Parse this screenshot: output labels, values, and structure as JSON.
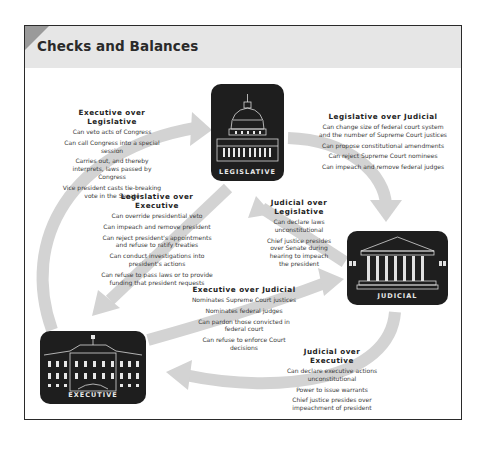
{
  "title": "Checks and Balances",
  "branches": {
    "legislative": {
      "label": "LEGISLATIVE",
      "icon": "capitol-building-icon"
    },
    "judicial": {
      "label": "JUDICIAL",
      "icon": "supreme-court-icon"
    },
    "executive": {
      "label": "EXECUTIVE",
      "icon": "white-house-icon"
    }
  },
  "colors": {
    "arrow": "#d0d0d0",
    "branch_bg": "#1e1e1e",
    "header_bg": "#e6e6e6",
    "border": "#2a2a2a"
  },
  "checks": {
    "exec_over_leg": {
      "heading": "Executive over Legislative",
      "items": [
        "Can veto acts of Congress",
        "Can call Congress into a special session",
        "Carries out, and thereby interprets, laws passed by Congress",
        "Vice president casts tie-breaking vote in the Senate"
      ]
    },
    "leg_over_jud": {
      "heading": "Legislative over Judicial",
      "items": [
        "Can change size of federal court system and the number of Supreme Court justices",
        "Can propose constitutional amendments",
        "Can reject Supreme Court nominees",
        "Can impeach and remove federal judges"
      ]
    },
    "leg_over_exec": {
      "heading": "Legislative over Executive",
      "items": [
        "Can override presidential veto",
        "Can impeach and remove president",
        "Can reject president's appointments and refuse to ratify treaties",
        "Can conduct investigations into president's actions",
        "Can refuse to pass laws or to provide funding that president requests"
      ]
    },
    "jud_over_leg": {
      "heading": "Judicial over Legislative",
      "items": [
        "Can declare laws unconstitutional",
        "Chief justice presides over Senate during hearing to impeach the president"
      ]
    },
    "exec_over_jud": {
      "heading": "Executive over Judicial",
      "items": [
        "Nominates Supreme Court justices",
        "Nominates federal judges",
        "Can pardon those convicted in federal court",
        "Can refuse to enforce Court decisions"
      ]
    },
    "jud_over_exec": {
      "heading": "Judicial over Executive",
      "items": [
        "Can declare executive actions unconstitutional",
        "Power to issue warrants",
        "Chief justice presides over impeachment of president"
      ]
    }
  }
}
